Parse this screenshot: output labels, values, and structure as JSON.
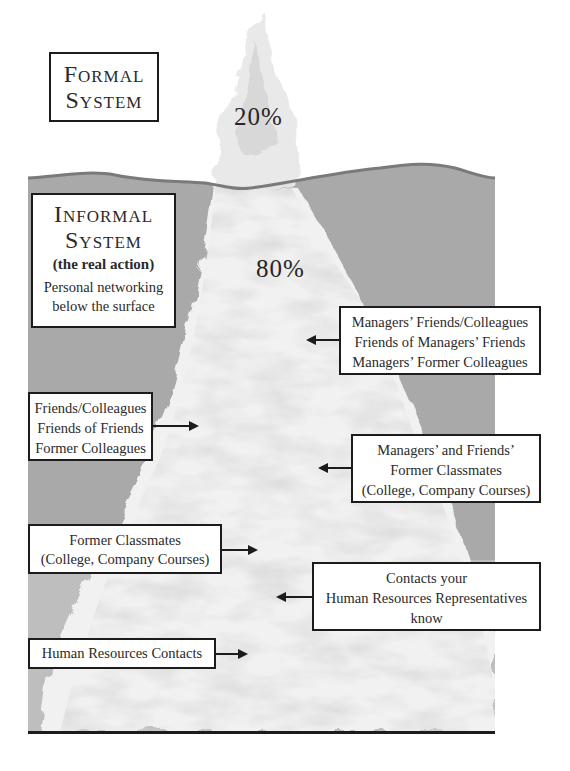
{
  "diagram": {
    "type": "iceberg",
    "colors": {
      "water": "#a9a9a9",
      "waterline": "#7a7a7a",
      "ice": "#f0f0f0",
      "ice_shadow": "#c8c8c8",
      "border": "#1c1c1c"
    },
    "above_surface": {
      "label_line1": "Formal",
      "label_line2": "System",
      "percent": "20%"
    },
    "below_surface": {
      "label_line1": "Informal",
      "label_line2": "System",
      "subtitle": "(the real action)",
      "desc_line1": "Personal networking",
      "desc_line2": "below the surface",
      "percent": "80%"
    },
    "callouts": [
      {
        "lines": [
          "Managers’ Friends/Colleagues",
          "Friends of Managers’ Friends",
          "Managers’ Former Colleagues"
        ],
        "arrow": "left"
      },
      {
        "lines": [
          "Friends/Colleagues",
          "Friends of Friends",
          "Former Colleagues"
        ],
        "arrow": "right"
      },
      {
        "lines": [
          "Managers’ and Friends’",
          "Former Classmates",
          "(College, Company Courses)"
        ],
        "arrow": "left"
      },
      {
        "lines": [
          "Former Classmates",
          "(College, Company Courses)"
        ],
        "arrow": "right"
      },
      {
        "lines": [
          "Contacts your",
          "Human Resources Representatives",
          "know"
        ],
        "arrow": "left"
      },
      {
        "lines": [
          "Human Resources Contacts"
        ],
        "arrow": "right"
      }
    ]
  }
}
